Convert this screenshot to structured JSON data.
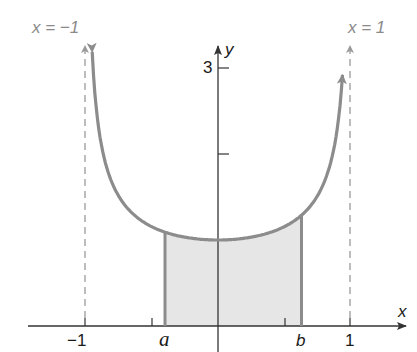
{
  "chart_data": {
    "type": "line",
    "title": "",
    "function": "y = 1/sqrt(1 - x^2)",
    "xlabel": "x",
    "ylabel": "y",
    "xlim": [
      -1.6,
      1.45
    ],
    "ylim": [
      0,
      3.3
    ],
    "grid": false,
    "x_ticks": [
      -1,
      -0.5,
      0.5,
      1
    ],
    "x_tick_labels": [
      "−1",
      "a",
      "b",
      "1"
    ],
    "y_ticks": [
      2,
      3
    ],
    "y_tick_labels": [
      "",
      "3"
    ],
    "series": [
      {
        "name": "curve",
        "x": [
          -0.95,
          -0.9,
          -0.8,
          -0.7,
          -0.6,
          -0.5,
          -0.4,
          -0.3,
          -0.2,
          -0.1,
          0,
          0.1,
          0.2,
          0.3,
          0.4,
          0.5,
          0.6,
          0.7,
          0.8,
          0.9,
          0.94
        ],
        "y": [
          3.2,
          2.29,
          1.67,
          1.4,
          1.25,
          1.15,
          1.09,
          1.05,
          1.02,
          1.01,
          1.0,
          1.01,
          1.02,
          1.05,
          1.09,
          1.15,
          1.25,
          1.4,
          1.67,
          2.29,
          2.93
        ]
      }
    ],
    "shaded_region": {
      "from": "a",
      "to": "b",
      "a_value": -0.4,
      "b_value": 0.63
    },
    "asymptotes": [
      {
        "x": -1,
        "label": "x = −1",
        "style": "dashed"
      },
      {
        "x": 1,
        "label": "x = 1",
        "style": "dashed"
      }
    ],
    "annotations": [
      "a",
      "b"
    ]
  },
  "labels": {
    "asym_left": "x = −1",
    "asym_right": "x = 1",
    "x_axis": "x",
    "y_axis": "y",
    "tick_neg1": "−1",
    "tick_pos1": "1",
    "tick_y3": "3",
    "a": "a",
    "b": "b"
  },
  "colors": {
    "curve": "#8c8c8c",
    "shade": "#e6e6e6",
    "axis": "#333333",
    "asymptote": "#999999"
  }
}
